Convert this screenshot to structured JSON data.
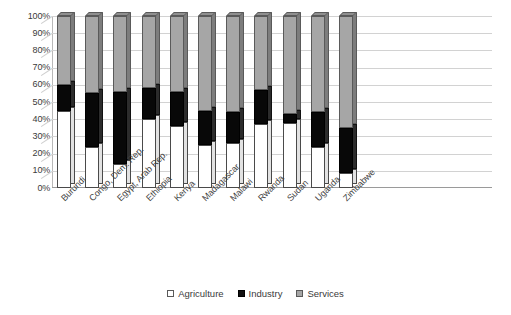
{
  "chart_data": {
    "type": "bar",
    "subtype": "100% stacked column (3D)",
    "title": "",
    "xlabel": "",
    "ylabel": "",
    "ylim": [
      0,
      100
    ],
    "ytick_labels": [
      "100%",
      "90%",
      "80%",
      "70%",
      "60%",
      "50%",
      "40%",
      "30%",
      "20%",
      "10%",
      "0%"
    ],
    "grid": true,
    "legend_position": "bottom",
    "stack_order_bottom_to_top": [
      "Agriculture",
      "Industry",
      "Services"
    ],
    "categories": [
      "Burundi",
      "Congo, Dem. Rep.",
      "Egypt, Arab Rep.",
      "Ethiopia",
      "Kenya",
      "Madagascar",
      "Malawi",
      "Rwanda",
      "Sudan",
      "Uganda",
      "Zimbabwe"
    ],
    "series": [
      {
        "name": "Agriculture",
        "color": "#ffffff",
        "values": [
          45,
          24,
          14,
          40,
          36,
          25,
          26,
          37,
          38,
          24,
          9
        ]
      },
      {
        "name": "Industry",
        "color": "#101010",
        "values": [
          15,
          31,
          42,
          18,
          20,
          20,
          18,
          20,
          5,
          20,
          26
        ]
      },
      {
        "name": "Services",
        "color": "#a6a6a6",
        "values": [
          40,
          45,
          44,
          42,
          44,
          55,
          56,
          43,
          57,
          56,
          65
        ]
      }
    ]
  },
  "legend": {
    "items": [
      {
        "label": "Agriculture",
        "swatch": "agri"
      },
      {
        "label": "Industry",
        "swatch": "ind"
      },
      {
        "label": "Services",
        "swatch": "svc"
      }
    ]
  },
  "colors": {
    "agriculture": "#ffffff",
    "industry": "#101010",
    "services": "#a6a6a6",
    "gridline": "#d2d2d2",
    "axis": "#9a9a9a",
    "text": "#3a3a3a"
  }
}
